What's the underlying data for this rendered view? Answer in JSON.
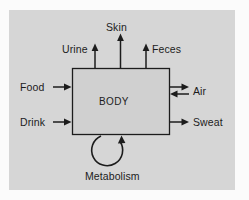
{
  "diagram": {
    "type": "block-flow",
    "title_text": "",
    "center_node": {
      "label": "BODY",
      "shape": "rectangle",
      "fill_color": "#d0d0d0",
      "stroke_color": "#1c1c1c"
    },
    "panel_background_color": "#d6d6d6",
    "page_background_color": "#fbfbfb",
    "text_color": "#1c1c1c",
    "inputs": [
      {
        "label": "Food",
        "direction": "into-body",
        "side": "left"
      },
      {
        "label": "Drink",
        "direction": "into-body",
        "side": "left"
      }
    ],
    "outputs": [
      {
        "label": "Skin",
        "direction": "out-of-body",
        "side": "top"
      },
      {
        "label": "Urine",
        "direction": "out-of-body",
        "side": "top"
      },
      {
        "label": "Feces",
        "direction": "out-of-body",
        "side": "top"
      },
      {
        "label": "Sweat",
        "direction": "out-of-body",
        "side": "right"
      }
    ],
    "bidirectional": [
      {
        "label": "Air",
        "direction": "both",
        "side": "right"
      }
    ],
    "internal_process": {
      "label": "Metabolism",
      "shape": "circular-loop-arrow",
      "position": "below-body"
    }
  }
}
